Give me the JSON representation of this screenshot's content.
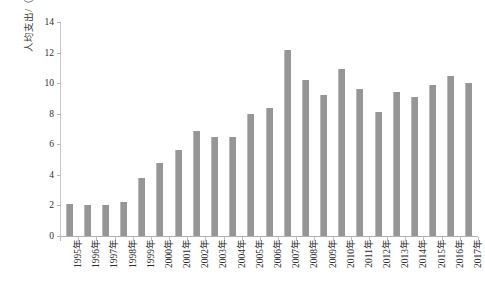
{
  "chart_data": {
    "type": "bar",
    "title": "",
    "subtitle": "",
    "xlabel": "",
    "ylabel": "人均支出/（美元/人）",
    "ylim": [
      0,
      14
    ],
    "ytick_interval": 2,
    "yticks": [
      0,
      2,
      4,
      6,
      8,
      10,
      12,
      14
    ],
    "grid": false,
    "legend": null,
    "bar_color": "#969696",
    "axis_color": "#c8c8c8",
    "categories": [
      "1995年",
      "1996年",
      "1997年",
      "1998年",
      "1999年",
      "2000年",
      "2001年",
      "2002年",
      "2003年",
      "2004年",
      "2005年",
      "2006年",
      "2007年",
      "2008年",
      "2009年",
      "2010年",
      "2011年",
      "2012年",
      "2013年",
      "2014年",
      "2015年",
      "2016年",
      "2017年"
    ],
    "values": [
      2.1,
      2.0,
      2.0,
      2.2,
      3.8,
      4.8,
      5.6,
      6.9,
      6.5,
      6.5,
      8.0,
      8.4,
      12.2,
      10.2,
      9.2,
      10.9,
      9.6,
      8.1,
      9.4,
      9.1,
      9.9,
      10.5,
      10.0
    ]
  }
}
